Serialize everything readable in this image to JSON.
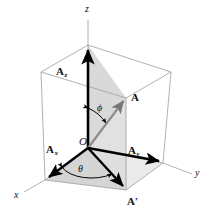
{
  "figure": {
    "axes": [
      {
        "name": "z-axis",
        "label": "z",
        "x": 88,
        "y": 8
      },
      {
        "name": "y-axis",
        "label": "y",
        "x": 194,
        "y": 169
      },
      {
        "name": "x-axis",
        "label": "x",
        "x": 18,
        "y": 192
      }
    ],
    "vectors": [
      {
        "name": "vector-A",
        "label": "A",
        "sub": "",
        "x": 131,
        "y": 92
      },
      {
        "name": "vector-A-prime",
        "label": "A",
        "prime": "′",
        "x": 130,
        "y": 196
      },
      {
        "name": "vector-Az",
        "label": "A",
        "sub": "z",
        "x": 58,
        "y": 68
      },
      {
        "name": "vector-Ax",
        "label": "A",
        "sub": "x",
        "x": 50,
        "y": 146
      },
      {
        "name": "vector-Ay",
        "label": "A",
        "sub": "y",
        "x": 131,
        "y": 148
      }
    ],
    "points": [
      {
        "name": "origin-O",
        "label": "O",
        "x": 81,
        "y": 139
      }
    ],
    "angles": [
      {
        "name": "angle-phi",
        "label": "ϕ",
        "x": 96,
        "y": 105
      },
      {
        "name": "angle-theta",
        "label": "θ",
        "x": 79,
        "y": 166
      }
    ],
    "colors": {
      "box_line": "#9a9a9a",
      "vector": "#000000",
      "shade_light": "#d8d8d8",
      "shade_mid": "#c9c9c9",
      "axis_line": "#9a9a9a",
      "background": "#ffffff"
    },
    "geometry": {
      "origin": [
        88,
        148
      ],
      "top_back": [
        88,
        45
      ],
      "top_left": [
        41,
        72
      ],
      "top_right": [
        171,
        72
      ],
      "top_front": [
        126,
        98
      ],
      "bot_back": [
        88,
        148
      ],
      "bot_left": [
        45,
        180
      ],
      "bot_right": [
        163,
        163
      ],
      "bot_front": [
        126,
        190
      ]
    }
  }
}
